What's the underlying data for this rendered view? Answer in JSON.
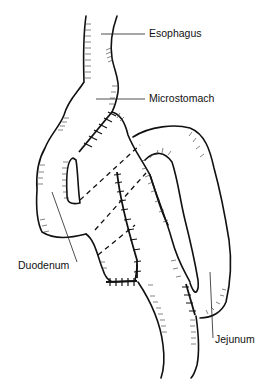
{
  "diagram": {
    "type": "anatomical-illustration",
    "labels": {
      "esophagus": "Esophagus",
      "microstomach": "Microstomach",
      "duodenum": "Duodenum",
      "jejunum": "Jejunum"
    }
  }
}
